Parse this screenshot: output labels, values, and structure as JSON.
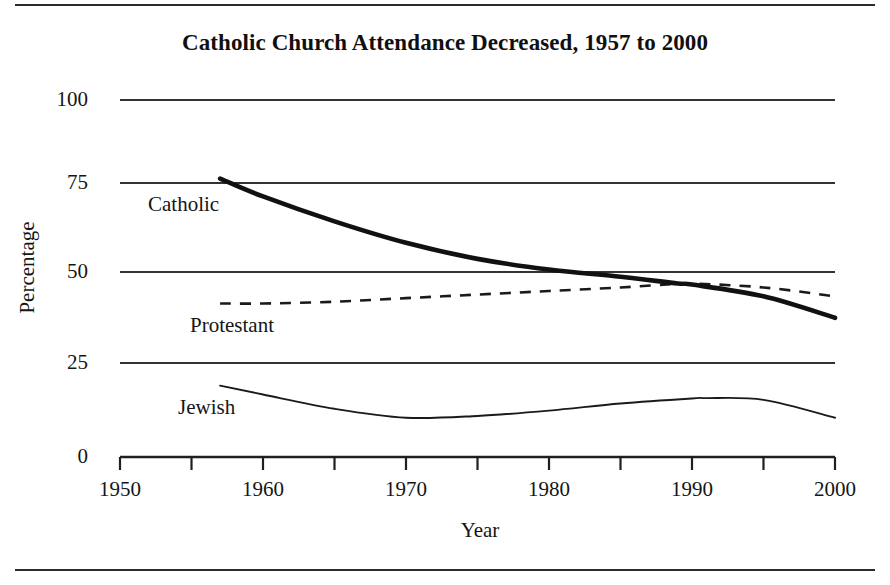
{
  "figure": {
    "title": "Catholic Church Attendance Decreased, 1957 to 2000",
    "x_axis_title": "Year",
    "y_axis_title": "Percentage"
  },
  "labels": {
    "catholic": "Catholic",
    "protestant": "Protestant",
    "jewish": "Jewish"
  },
  "ticks": {
    "y": [
      "100",
      "75",
      "50",
      "25",
      "0"
    ],
    "x": [
      "1950",
      "1960",
      "1970",
      "1980",
      "1990",
      "2000"
    ]
  },
  "colors": {
    "line": "#1a1a1a",
    "gridline": "#3a3a3a",
    "rule": "#2b2b2b",
    "background": "#ffffff"
  },
  "chart_data": {
    "type": "line",
    "title": "Catholic Church Attendance Decreased, 1957 to 2000",
    "xlabel": "Year",
    "ylabel": "Percentage",
    "xlim": [
      1950,
      2000
    ],
    "ylim": [
      0,
      100
    ],
    "xticks": [
      1950,
      1960,
      1970,
      1980,
      1990,
      2000
    ],
    "xminorticks": [
      1955,
      1965,
      1975,
      1985,
      1995
    ],
    "yticks": [
      0,
      25,
      50,
      75,
      100
    ],
    "grid": "horizontal",
    "legend": "inline-labels",
    "series": [
      {
        "name": "Catholic",
        "style": "solid-thick",
        "x": [
          1957,
          1960,
          1965,
          1970,
          1975,
          1980,
          1985,
          1989,
          1990,
          1995,
          2000
        ],
        "values": [
          78,
          73,
          66,
          60,
          55.5,
          52.5,
          50.5,
          48.6,
          48.3,
          45,
          39
        ]
      },
      {
        "name": "Protestant",
        "style": "dashed",
        "x": [
          1957,
          1960,
          1965,
          1970,
          1975,
          1980,
          1985,
          1989,
          1990,
          1995,
          2000
        ],
        "values": [
          43,
          43,
          43.5,
          44.5,
          45.5,
          46.5,
          47.5,
          48.5,
          48.6,
          47.5,
          45
        ]
      },
      {
        "name": "Jewish",
        "style": "solid-thin",
        "x": [
          1957,
          1960,
          1965,
          1970,
          1975,
          1980,
          1985,
          1990,
          1991,
          1995,
          2000
        ],
        "values": [
          20,
          17.5,
          13.5,
          11,
          11.5,
          13,
          15,
          16.4,
          16.5,
          16,
          11
        ]
      }
    ]
  }
}
